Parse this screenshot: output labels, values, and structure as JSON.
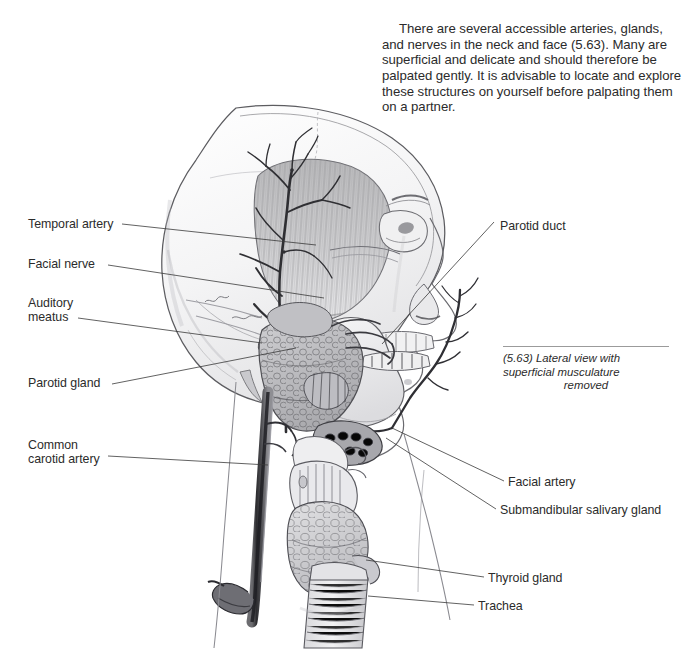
{
  "page": {
    "background": "#ffffff",
    "text_color": "#2b2b2b",
    "width": 692,
    "height": 670
  },
  "intro": {
    "paragraph": "There are several accessible arteries, glands, and nerves in the neck and face (5.63).  Many are superficial and delicate and should therefore be palpated gently.  It is advisable to locate and explore these structures on yourself before palpating them on a partner."
  },
  "caption": {
    "line1": "(5.63) Lateral view with",
    "line2": "superficial musculature",
    "line3": "removed",
    "rule_color": "#9b9b9b"
  },
  "labels": {
    "left": [
      {
        "id": "temporal-artery",
        "text": "Temporal artery",
        "x": 28,
        "y": 217
      },
      {
        "id": "facial-nerve",
        "text": "Facial nerve",
        "x": 28,
        "y": 257
      },
      {
        "id": "auditory-meatus",
        "text": "Auditory\nmeatus",
        "x": 28,
        "y": 296
      },
      {
        "id": "parotid-gland",
        "text": "Parotid gland",
        "x": 28,
        "y": 376
      },
      {
        "id": "common-carotid",
        "text": "Common\ncarotid artery",
        "x": 28,
        "y": 438
      }
    ],
    "right": [
      {
        "id": "parotid-duct",
        "text": "Parotid duct",
        "x": 500,
        "y": 219
      },
      {
        "id": "facial-artery",
        "text": "Facial artery",
        "x": 508,
        "y": 475
      },
      {
        "id": "submandibular",
        "text": "Submandibular salivary gland",
        "x": 500,
        "y": 503
      },
      {
        "id": "thyroid-gland",
        "text": "Thyroid gland",
        "x": 488,
        "y": 571
      },
      {
        "id": "trachea",
        "text": "Trachea",
        "x": 478,
        "y": 599
      }
    ]
  },
  "illustration": {
    "title": "Lateral view of head and neck with superficial musculature removed",
    "style": "graphite pencil anatomical drawing",
    "line_color": "#3a3a3a",
    "structures": [
      "cranium",
      "temporalis muscle",
      "superficial temporal artery",
      "facial nerve",
      "auditory meatus",
      "parotid gland",
      "parotid duct",
      "mandible",
      "facial artery",
      "submandibular salivary gland",
      "common carotid artery",
      "hyoid bone",
      "thyroid cartilage",
      "thyroid gland",
      "trachea",
      "nasal profile",
      "orbit",
      "teeth"
    ]
  }
}
